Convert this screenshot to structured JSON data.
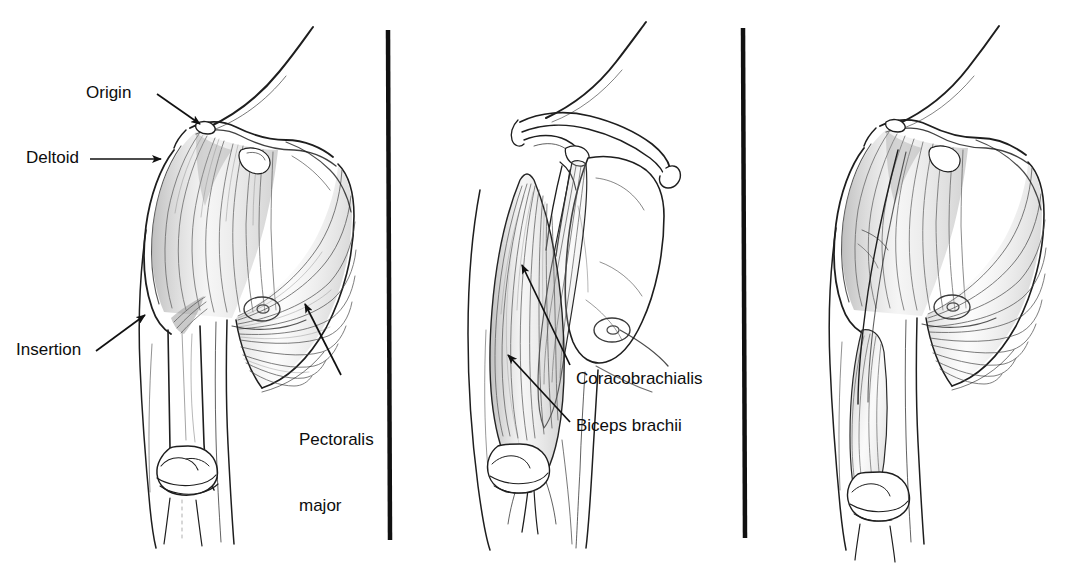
{
  "figure": {
    "background_color": "#ffffff",
    "ink_color": "#1a1a1a",
    "divider_color": "#111111",
    "panel_count": 3
  },
  "panels": [
    {
      "id": "panel-1",
      "caption": "Superficial view: deltoid and pectoralis major",
      "labels": [
        {
          "key": "origin",
          "text": "Origin"
        },
        {
          "key": "deltoid",
          "text": "Deltoid"
        },
        {
          "key": "insertion",
          "text": "Insertion"
        },
        {
          "key": "pectoralis_major",
          "text": "Pectoralis\nmajor",
          "line1": "Pectoralis",
          "line2": "major"
        }
      ]
    },
    {
      "id": "panel-2",
      "caption": "Deep view: scapula, clavicle, biceps brachii and coracobrachialis",
      "labels": [
        {
          "key": "coracobrachialis",
          "text": "Coracobrachialis"
        },
        {
          "key": "biceps_brachii",
          "text": "Biceps brachii"
        }
      ]
    },
    {
      "id": "panel-3",
      "caption": "Superficial view, unlabeled",
      "labels": []
    }
  ],
  "label_text": {
    "origin": "Origin",
    "deltoid": "Deltoid",
    "insertion": "Insertion",
    "pectoralis_major_line1": "Pectoralis",
    "pectoralis_major_line2": "major",
    "coracobrachialis": "Coracobrachialis",
    "biceps_brachii": "Biceps brachii"
  },
  "dividers": [
    {
      "key": "divider-1",
      "x": 388,
      "y_top": 30,
      "y_bottom": 540
    },
    {
      "key": "divider-2",
      "x": 743,
      "y_top": 28,
      "y_bottom": 538
    }
  ]
}
